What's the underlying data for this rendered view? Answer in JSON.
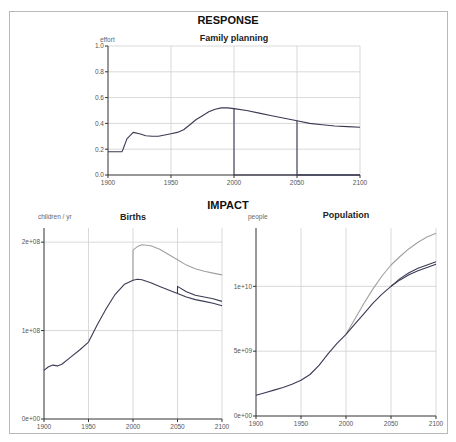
{
  "sections": {
    "response_title": "RESPONSE",
    "impact_title": "IMPACT"
  },
  "chart_data": [
    {
      "type": "line",
      "title": "Family planning",
      "section": "RESPONSE",
      "ylabel": "effort",
      "xlabel": "",
      "xlim": [
        1900,
        2100
      ],
      "ylim": [
        0,
        1.0
      ],
      "x_ticks": [
        "1900",
        "1950",
        "2000",
        "2050",
        "2100"
      ],
      "y_ticks": [
        "0.0",
        "0.2",
        "0.4",
        "0.6",
        "0.8",
        "1.0"
      ],
      "grid": true,
      "series": [
        {
          "name": "effort (full)",
          "color": "#3a3a55",
          "x": [
            1900,
            1911,
            1912,
            1915,
            1920,
            1925,
            1930,
            1935,
            1940,
            1945,
            1950,
            1955,
            1960,
            1965,
            1970,
            1975,
            1980,
            1985,
            1990,
            1995,
            2000,
            2010,
            2020,
            2030,
            2040,
            2050,
            2060,
            2070,
            2080,
            2090,
            2100
          ],
          "values": [
            0.18,
            0.18,
            0.2,
            0.28,
            0.33,
            0.32,
            0.305,
            0.3,
            0.3,
            0.31,
            0.32,
            0.33,
            0.35,
            0.39,
            0.43,
            0.46,
            0.49,
            0.51,
            0.52,
            0.52,
            0.515,
            0.5,
            0.48,
            0.46,
            0.44,
            0.42,
            0.4,
            0.39,
            0.38,
            0.375,
            0.37
          ]
        },
        {
          "name": "effort (stopped 2000)",
          "color": "#3a3a55",
          "x": [
            2000,
            2000,
            2100
          ],
          "values": [
            0.515,
            0.0,
            0.0
          ]
        },
        {
          "name": "effort (stopped 2050)",
          "color": "#3a3a55",
          "x": [
            2050,
            2050,
            2100
          ],
          "values": [
            0.42,
            0.0,
            0.0
          ]
        }
      ]
    },
    {
      "type": "line",
      "title": "Births",
      "section": "IMPACT",
      "ylabel": "children / yr",
      "xlabel": "",
      "xlim": [
        1900,
        2100
      ],
      "ylim": [
        0,
        216000000
      ],
      "x_ticks": [
        "1900",
        "1950",
        "2000",
        "2050",
        "2100"
      ],
      "y_ticks": [
        "0e+00",
        "1e+08",
        "2e+08"
      ],
      "grid": true,
      "series": [
        {
          "name": "births (baseline)",
          "color": "#3a3a55",
          "x": [
            1900,
            1905,
            1910,
            1915,
            1920,
            1930,
            1940,
            1950,
            1960,
            1970,
            1980,
            1990,
            2000,
            2005,
            2010,
            2020,
            2030,
            2040,
            2050,
            2060,
            2070,
            2080,
            2090,
            2100
          ],
          "values": [
            55000000,
            59000000,
            61000000,
            60000000,
            62000000,
            70000000,
            78000000,
            87000000,
            107000000,
            125000000,
            141000000,
            152000000,
            157000000,
            158000000,
            157500000,
            154000000,
            150000000,
            146000000,
            142000000,
            138000000,
            135000000,
            133000000,
            131000000,
            128000000
          ]
        },
        {
          "name": "births (stop 2000)",
          "color": "#a0a0a0",
          "x": [
            2000,
            2000,
            2005,
            2010,
            2020,
            2030,
            2040,
            2050,
            2060,
            2070,
            2080,
            2090,
            2100
          ],
          "values": [
            157000000,
            191000000,
            195000000,
            197000000,
            196000000,
            192000000,
            186000000,
            180000000,
            174000000,
            170000000,
            167000000,
            165000000,
            163000000
          ]
        },
        {
          "name": "births (stop 2050)",
          "color": "#3a3a55",
          "x": [
            2050,
            2050,
            2060,
            2070,
            2080,
            2090,
            2100
          ],
          "values": [
            142000000,
            150000000,
            144000000,
            140000000,
            138000000,
            136000000,
            133000000
          ]
        }
      ]
    },
    {
      "type": "line",
      "title": "Population",
      "section": "IMPACT",
      "ylabel": "people",
      "xlabel": "",
      "xlim": [
        1900,
        2100
      ],
      "ylim": [
        0,
        14500000000
      ],
      "x_ticks": [
        "1900",
        "1950",
        "2000",
        "2050",
        "2100"
      ],
      "y_ticks": [
        "0e+00",
        "5e+09",
        "1e+10"
      ],
      "grid": true,
      "series": [
        {
          "name": "population (baseline)",
          "color": "#3a3a55",
          "x": [
            1900,
            1910,
            1920,
            1930,
            1940,
            1950,
            1960,
            1970,
            1980,
            1990,
            2000,
            2010,
            2020,
            2030,
            2040,
            2050,
            2060,
            2070,
            2080,
            2090,
            2100
          ],
          "values": [
            1600000000,
            1800000000,
            2000000000,
            2200000000,
            2450000000,
            2750000000,
            3200000000,
            3900000000,
            4800000000,
            5600000000,
            6300000000,
            7100000000,
            7900000000,
            8700000000,
            9400000000,
            10000000000,
            10500000000,
            10900000000,
            11200000000,
            11450000000,
            11700000000
          ]
        },
        {
          "name": "population (stop 2000)",
          "color": "#a0a0a0",
          "x": [
            2000,
            2010,
            2020,
            2030,
            2040,
            2050,
            2060,
            2070,
            2080,
            2090,
            2100
          ],
          "values": [
            6300000000,
            7500000000,
            8700000000,
            9800000000,
            10800000000,
            11650000000,
            12300000000,
            12900000000,
            13400000000,
            13800000000,
            14100000000
          ]
        },
        {
          "name": "population (stop 2050)",
          "color": "#3a3a55",
          "x": [
            2050,
            2060,
            2070,
            2080,
            2090,
            2100
          ],
          "values": [
            10000000000,
            10600000000,
            11050000000,
            11400000000,
            11650000000,
            11900000000
          ]
        }
      ]
    }
  ]
}
